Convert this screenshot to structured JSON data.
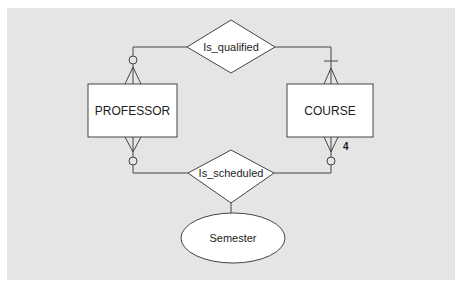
{
  "diagram": {
    "type": "entity-relationship",
    "colors": {
      "panel_background": "#e5e5e5",
      "shape_fill": "#ffffff",
      "line": "#444444",
      "text": "#1c1c1c"
    },
    "entities": [
      {
        "id": "professor",
        "label": "PROFESSOR"
      },
      {
        "id": "course",
        "label": "COURSE"
      }
    ],
    "relationships": [
      {
        "id": "is_qualified",
        "label": "Is_qualified",
        "connects": [
          "professor",
          "course"
        ],
        "professor_end": "optional-many",
        "course_end": "mandatory-many"
      },
      {
        "id": "is_scheduled",
        "label": "Is_scheduled",
        "connects": [
          "professor",
          "course"
        ],
        "professor_end": "optional-many",
        "course_end": "optional-many",
        "course_cardinality_label": "4"
      }
    ],
    "attributes": [
      {
        "id": "semester",
        "label": "Semester",
        "attached_to": "is_scheduled"
      }
    ]
  }
}
